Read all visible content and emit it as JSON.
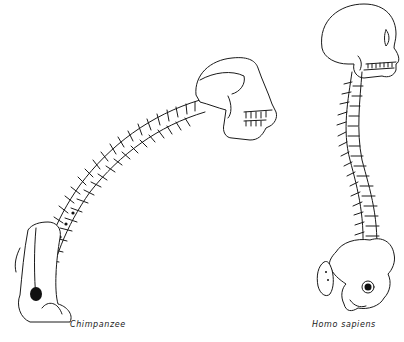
{
  "figure": {
    "subjects": [
      {
        "id": "chimpanzee",
        "label": "Chimpanzee",
        "posture": "quadrupedal, single C-shaped spinal curve, skull projects forward"
      },
      {
        "id": "homo-sapiens",
        "label": "Homo sapiens",
        "posture": "bipedal, S-shaped spinal curve, skull balanced atop spine"
      }
    ],
    "colors": {
      "ink": "#1a1a1a",
      "background": "#ffffff"
    }
  }
}
